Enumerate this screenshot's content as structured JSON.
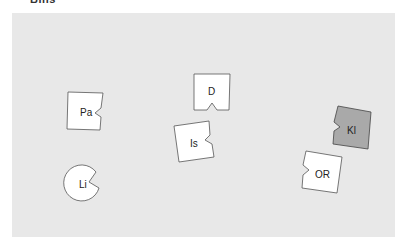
{
  "header": {
    "label": "Bins"
  },
  "board": {
    "background": "#e8e8e8"
  },
  "pieces": [
    {
      "id": "pa",
      "label": "Pa",
      "shape": "square-notch-right",
      "fill": "#ffffff"
    },
    {
      "id": "d",
      "label": "D",
      "shape": "square-notch-bottom",
      "fill": "#ffffff"
    },
    {
      "id": "is",
      "label": "Is",
      "shape": "square-notch-right",
      "fill": "#ffffff"
    },
    {
      "id": "kl",
      "label": "Kl",
      "shape": "square-notch-left",
      "fill": "#a9a9a9"
    },
    {
      "id": "or",
      "label": "OR",
      "shape": "square-notch-left",
      "fill": "#ffffff"
    },
    {
      "id": "li",
      "label": "Li",
      "shape": "circle-notch",
      "fill": "#ffffff"
    }
  ]
}
